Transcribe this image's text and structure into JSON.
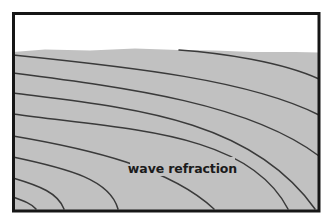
{
  "diagram": {
    "label": "wave refraction",
    "colors": {
      "background": "#ffffff",
      "water": "#c1c1c1",
      "wave_line": "#3a3a3a",
      "frame": "#161616",
      "label_text": "#1b1b1b"
    },
    "shoreline_points": "13,52 45,49.5 90,50.5 135,48.5 178,50 215,50.5 252,52 295,52 319,52.5 319,210.5 13,210.5",
    "wave_paths": [
      "M 179,50 C 222,53 282,62 319,79",
      "M 13,55 C 130,67 250,80 319,115",
      "M 13,73 C 130,88 250,104 319,156",
      "M 13,93 C 130,108 250,118 315,209",
      "M 13,114 C 130,130 248,132 288,209",
      "M 13,136 C 90,149 170,168 214,209",
      "M 13,157 C 70,169 110,180 118,209",
      "M 13,178 C 40,186 58,193 64,209",
      "M 13,197 C 24,201 32,204 36,209"
    ],
    "label_backdrop": {
      "x": 130,
      "y": 157,
      "width": 105,
      "height": 19
    },
    "label_pos": {
      "x": 182.5,
      "y": 172.5
    },
    "frame_rect": {
      "x": 13.5,
      "y": 13.5,
      "width": 305.5,
      "height": 197.5,
      "stroke_width": 3
    }
  }
}
